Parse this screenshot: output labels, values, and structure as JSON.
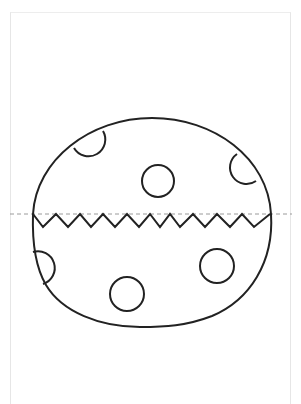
{
  "header": {
    "cutoff_text": ""
  },
  "worksheet": {
    "subject": "Easter egg cut-out (zigzag crack)",
    "colors": {
      "outline": "#222222",
      "fold_line": "#9a9a9a",
      "page_border": "#e6e6e6",
      "background": "#ffffff"
    },
    "fold_line": {
      "y": 214,
      "x1": 10,
      "x2": 292,
      "style": "dashed"
    },
    "egg": {
      "top_y": 118,
      "bottom_y": 326,
      "left_x": 32,
      "right_x": 271
    },
    "zigzag": {
      "points": [
        [
          33,
          214
        ],
        [
          43,
          227
        ],
        [
          56,
          214
        ],
        [
          68,
          227
        ],
        [
          80,
          214
        ],
        [
          91,
          227
        ],
        [
          103,
          214
        ],
        [
          115,
          227
        ],
        [
          127,
          214
        ],
        [
          139,
          227
        ],
        [
          150,
          214
        ],
        [
          160,
          227
        ],
        [
          170,
          214
        ],
        [
          180,
          227
        ],
        [
          193,
          214
        ],
        [
          205,
          227
        ],
        [
          217,
          214
        ],
        [
          230,
          227
        ],
        [
          242,
          214
        ],
        [
          254,
          227
        ],
        [
          270,
          214
        ]
      ]
    },
    "dots": [
      {
        "type": "edge",
        "name": "top-left-dot"
      },
      {
        "type": "full",
        "name": "upper-center-dot",
        "cx": 158,
        "cy": 181,
        "r": 16
      },
      {
        "type": "edge",
        "name": "right-dot"
      },
      {
        "type": "edge",
        "name": "lower-left-dot"
      },
      {
        "type": "full",
        "name": "lower-center-dot",
        "cx": 127,
        "cy": 294,
        "r": 17
      },
      {
        "type": "full",
        "name": "lower-right-dot",
        "cx": 217,
        "cy": 266,
        "r": 17
      }
    ]
  }
}
